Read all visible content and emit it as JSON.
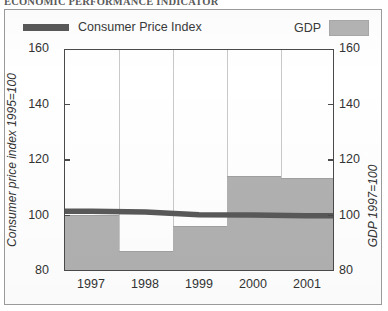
{
  "document": {
    "title": "ECONOMIC PERFORMANCE INDICATOR"
  },
  "legend": {
    "series_line_label": "Consumer Price Index",
    "series_bar_label": "GDP",
    "line_color": "#595959",
    "bar_color": "#b1b1b1"
  },
  "axes": {
    "left_title": "Consumer price index 1995=100",
    "right_title": "GDP 1997=100",
    "y_ticks": [
      "160",
      "140",
      "120",
      "100",
      "80"
    ],
    "x_ticks": [
      "1997",
      "1998",
      "1999",
      "2000",
      "2001"
    ]
  },
  "chart_data": {
    "type": "bar",
    "title": "ECONOMIC PERFORMANCE INDICATOR",
    "categories": [
      "1997",
      "1998",
      "1999",
      "2000",
      "2001"
    ],
    "series": [
      {
        "name": "GDP",
        "type": "bar",
        "axis": "right",
        "unit": "1997=100",
        "values": [
          100,
          87,
          96,
          114,
          113
        ],
        "color": "#b1b1b1"
      },
      {
        "name": "Consumer Price Index",
        "type": "line",
        "axis": "left",
        "unit": "1995=100",
        "values": [
          101.5,
          101.2,
          100.2,
          100.1,
          99.8
        ],
        "color": "#595959"
      }
    ],
    "xlabel": "",
    "ylabel": "Consumer price index 1995=100",
    "y2label": "GDP 1997=100",
    "ylim": [
      80,
      160
    ],
    "y2lim": [
      80,
      160
    ],
    "yticks": [
      80,
      100,
      120,
      140,
      160
    ],
    "grid": "vertical",
    "legend_position": "top"
  }
}
